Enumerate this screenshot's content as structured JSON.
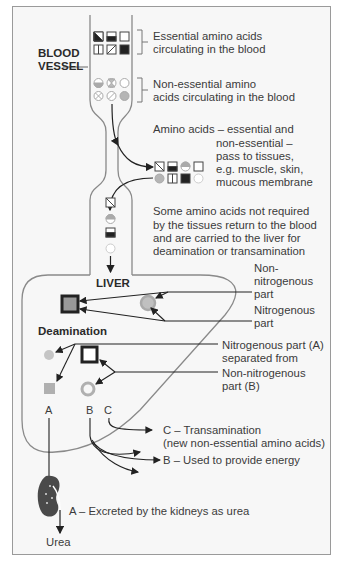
{
  "diagram": {
    "type": "biology-flow"
  },
  "labels": {
    "blood_vessel": [
      "BLOOD",
      "VESSEL"
    ],
    "essential": [
      "Essential amino acids",
      "circulating in the blood"
    ],
    "non_essential": [
      "Non-essential amino",
      "acids circulating in the blood"
    ],
    "tissues": [
      "Amino acids – essential and",
      "non-essential –",
      "pass to tissues,",
      "e.g. muscle, skin,",
      "mucous membrane"
    ],
    "return": [
      "Some amino acids not required",
      "by the tissues return to the blood",
      "and are carried to the liver for",
      "deamination or transamination"
    ],
    "liver": "LIVER",
    "non_nitrogenous_top": [
      "Non-",
      "nitrogenous",
      "part"
    ],
    "nitrogenous_top": [
      "Nitrogenous",
      "part"
    ],
    "deamination": "Deamination",
    "nitrogenous_a": [
      "Nitrogenous part (A)",
      "separated from"
    ],
    "non_nitrogenous_b": [
      "Non-nitrogenous",
      "part (B)"
    ],
    "letter_a": "A",
    "letter_b": "B",
    "letter_c": "C",
    "transamination": [
      "C – Transamination",
      "(new non-essential amino acids)"
    ],
    "energy": "B – Used to provide energy",
    "excreted": "A – Excreted by the kidneys as urea",
    "urea": "Urea"
  },
  "symbols": {
    "essential": [
      "half-diagonal-square",
      "half-filled-square",
      "empty-square",
      "split-square",
      "slash-square",
      "filled-square"
    ],
    "non_essential": [
      "half-circle",
      "hourglass-circle",
      "empty-circle",
      "x-circle",
      "slash-circle",
      "filled-circle"
    ],
    "tissue_row1": [
      "slash-square",
      "half-filled-square",
      "half-circle",
      "empty-square"
    ],
    "tissue_row2": [
      "filled-circle",
      "split-square",
      "filled-square",
      "empty-circle"
    ],
    "return_column": [
      "slash-square",
      "half-circle",
      "half-filled-square",
      "empty-circle"
    ]
  },
  "colors": {
    "frame_bg": "#f7f7f7",
    "line": "#333333",
    "outline": "#8a8a8a",
    "grey_fill": "#b5b5b5",
    "dark_fill": "#2a2a2a",
    "kidney": "#4a4a4a"
  }
}
